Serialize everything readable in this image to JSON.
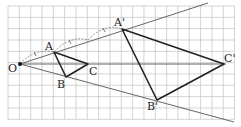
{
  "diagram": {
    "type": "dilation-homothety",
    "grid": {
      "cols": 20,
      "rows": 10,
      "cell_px": 11.33,
      "origin_px": [
        8,
        6
      ],
      "line_color": "#c8c8c8"
    },
    "center": {
      "label": "O",
      "grid": [
        1,
        5.1
      ]
    },
    "scale_factor": 3,
    "original_triangle": {
      "A": {
        "label": "A",
        "offset": [
          3,
          -1
        ]
      },
      "B": {
        "label": "B",
        "offset": [
          4,
          1.15
        ]
      },
      "C": {
        "label": "C",
        "offset": [
          6,
          0
        ]
      }
    },
    "image_triangle": {
      "A'": {
        "label": "A'",
        "offset": [
          9,
          -3
        ]
      },
      "B'": {
        "label": "B'",
        "offset": [
          12,
          3.2
        ]
      },
      "C'": {
        "label": "C'",
        "offset": [
          18,
          0
        ]
      }
    },
    "rays": [
      "O→A'",
      "O→C'",
      "O→B'"
    ],
    "arc_marks": [
      "O–A",
      "A–(mid)",
      "(mid)–A'"
    ],
    "colors": {
      "triangle": "#222222",
      "ray": "#555555",
      "arc": "#777777",
      "point": "#111111"
    }
  },
  "labels": {
    "O": "O",
    "A": "A",
    "B": "B",
    "C": "C",
    "A_prime": "A'",
    "B_prime": "B'",
    "C_prime": "C'"
  }
}
